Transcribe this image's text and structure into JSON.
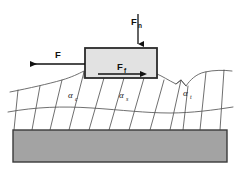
{
  "figure": {
    "type": "mechanical-schematic"
  },
  "colors": {
    "background": "#ffffff",
    "block_fill": "#e2e2e2",
    "block_stroke": "#2b2b2b",
    "substrate_fill": "#a3a3a3",
    "substrate_stroke": "#3a3a3a",
    "line": "#4a4a4a",
    "arrow": "#111111",
    "text": "#111111"
  },
  "labels": {
    "normal_force": {
      "symbol": "F",
      "subscript": "n"
    },
    "applied_force": {
      "symbol": "F",
      "subscript": ""
    },
    "friction_force": {
      "symbol": "F",
      "subscript": "f"
    },
    "angle_c": {
      "symbol": "α",
      "subscript": "c"
    },
    "angle_s": {
      "symbol": "α",
      "subscript": "s"
    },
    "angle_t": {
      "symbol": "α",
      "subscript": "t"
    }
  },
  "arrows": {
    "normal_force": {
      "name": "F_n",
      "direction": "down",
      "x1": 138,
      "y1": 14,
      "x2": 138,
      "y2": 45
    },
    "applied_force": {
      "name": "F",
      "direction": "left",
      "x1": 85,
      "y1": 64,
      "x2": 28,
      "y2": 64
    },
    "friction_force": {
      "name": "F_f",
      "direction": "right",
      "x1": 98,
      "y1": 74,
      "x2": 142,
      "y2": 74
    }
  },
  "block": {
    "name": "slider-block",
    "x": 85,
    "y": 48,
    "width": 72,
    "height": 30
  },
  "substrate": {
    "name": "substrate-bar",
    "x": 13,
    "y": 130,
    "width": 214,
    "height": 32
  }
}
